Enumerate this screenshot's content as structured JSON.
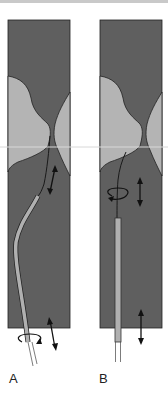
{
  "figure": {
    "panels": [
      {
        "id": "A",
        "label": "A",
        "technique": "angled catheter with guidewire, rotation and advance/withdraw"
      },
      {
        "id": "B",
        "label": "B",
        "technique": "straight catheter with curved guidewire tip, rotation and advance/withdraw"
      }
    ],
    "colors": {
      "vessel_lumen": "#5f5f5f",
      "plaque": "#b4b4b4",
      "outline": "#222222",
      "catheter": "#b0b0b0",
      "background": "#ffffff"
    },
    "icons": [
      "rotation-arrow-icon",
      "bidirectional-arrow-icon"
    ]
  }
}
